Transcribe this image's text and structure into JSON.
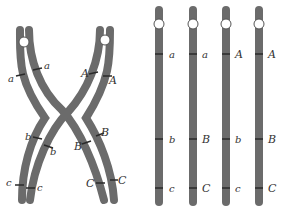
{
  "figure": {
    "colors": {
      "chromosome": "#6b6b6b",
      "band": "#2a2a2a",
      "centromere": "#ffffff",
      "label": "#333333"
    },
    "crossover": {
      "left_chromatid_labels": [
        "a",
        "b",
        "c"
      ],
      "left_inner_labels": [
        "a",
        "b",
        "c"
      ],
      "right_inner_labels": [
        "A",
        "B",
        "C"
      ],
      "right_chromatid_labels": [
        "A",
        "B",
        "C"
      ]
    },
    "chromatids": [
      {
        "labels": [
          "a",
          "b",
          "c"
        ]
      },
      {
        "labels": [
          "a",
          "B",
          "C"
        ]
      },
      {
        "labels": [
          "A",
          "b",
          "c"
        ]
      },
      {
        "labels": [
          "A",
          "B",
          "C"
        ]
      }
    ]
  }
}
